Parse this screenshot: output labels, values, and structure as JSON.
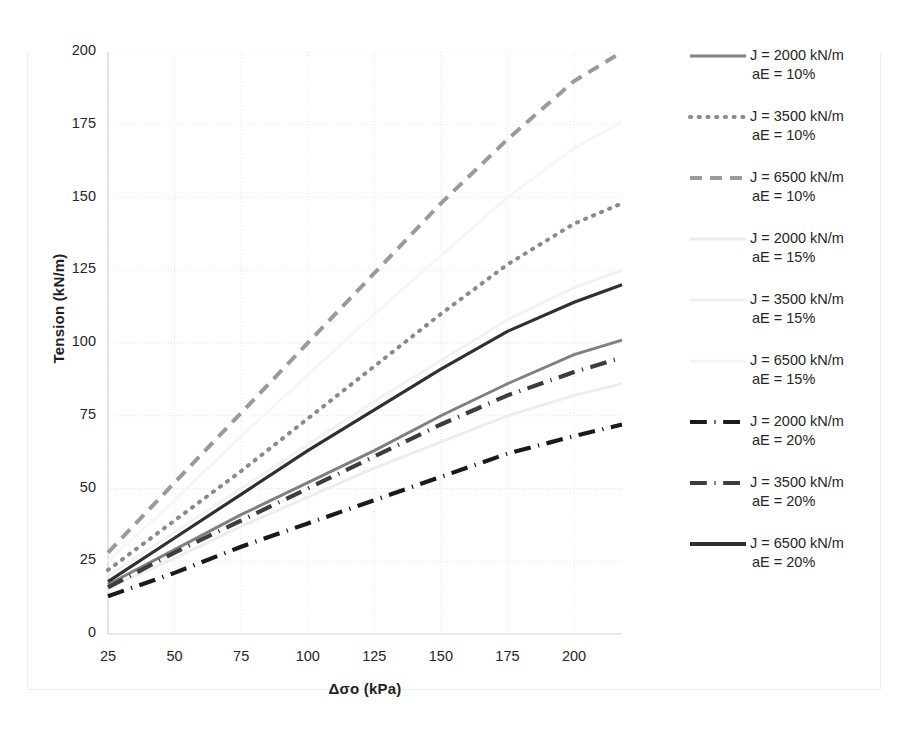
{
  "chart_data": {
    "type": "line",
    "title": "",
    "xlabel": "Δσo (kPa)",
    "ylabel": "Tension (kN/m)",
    "xlim": [
      25,
      218
    ],
    "ylim": [
      0,
      200
    ],
    "xticks": [
      25,
      50,
      75,
      100,
      125,
      150,
      175,
      200
    ],
    "yticks": [
      0,
      25,
      50,
      75,
      100,
      125,
      150,
      175,
      200
    ],
    "grid": "dotted-light",
    "legend_position": "right",
    "x": [
      25,
      50,
      75,
      100,
      125,
      150,
      175,
      200,
      218
    ],
    "series": [
      {
        "name": "J = 2000 kN/m  aE = 10%",
        "J": 2000,
        "aE": "10%",
        "style": "solid",
        "color": "#808080",
        "width": 3.0,
        "values": [
          17,
          29,
          41,
          52,
          63,
          75,
          86,
          96,
          101
        ]
      },
      {
        "name": "J = 3500 kN/m  aE = 10%",
        "J": 3500,
        "aE": "10%",
        "style": "dotted",
        "color": "#8a8a8a",
        "width": 4.0,
        "values": [
          22,
          39,
          56,
          74,
          92,
          110,
          127,
          141,
          148
        ]
      },
      {
        "name": "J = 6500 kN/m  aE = 10%",
        "J": 6500,
        "aE": "10%",
        "style": "dashed",
        "color": "#9a9a9a",
        "width": 4.0,
        "values": [
          28,
          52,
          76,
          100,
          124,
          148,
          170,
          190,
          200
        ]
      },
      {
        "name": "J = 2000 kN/m  aE = 15%",
        "J": 2000,
        "aE": "15%",
        "style": "solid",
        "color": "#ededed",
        "width": 3.0,
        "values": [
          16,
          26,
          37,
          47,
          57,
          66,
          75,
          82,
          86
        ]
      },
      {
        "name": "J = 3500 kN/m  aE = 15%",
        "J": 3500,
        "aE": "15%",
        "style": "solid",
        "color": "#f2f2f2",
        "width": 3.0,
        "values": [
          20,
          35,
          50,
          65,
          80,
          94,
          108,
          119,
          125
        ]
      },
      {
        "name": "J = 6500 kN/m  aE = 15%",
        "J": 6500,
        "aE": "15%",
        "style": "solid",
        "color": "#f6f6f6",
        "width": 3.0,
        "values": [
          25,
          46,
          68,
          89,
          110,
          130,
          150,
          167,
          176
        ]
      },
      {
        "name": "J = 2000 kN/m  aE = 20%",
        "J": 2000,
        "aE": "20%",
        "style": "dashdot",
        "color": "#1a1a1a",
        "width": 4.2,
        "values": [
          13,
          21,
          30,
          38,
          46,
          54,
          62,
          68,
          72
        ]
      },
      {
        "name": "J = 3500 kN/m  aE = 20%",
        "J": 3500,
        "aE": "20%",
        "style": "dashdot",
        "color": "#3d3d3d",
        "width": 4.2,
        "values": [
          16,
          28,
          39,
          50,
          61,
          72,
          82,
          90,
          95
        ]
      },
      {
        "name": "J = 6500 kN/m  aE = 20%",
        "J": 6500,
        "aE": "20%",
        "style": "solid",
        "color": "#303030",
        "width": 3.2,
        "values": [
          18,
          33,
          48,
          63,
          77,
          91,
          104,
          114,
          120
        ]
      }
    ]
  },
  "axes": {
    "y_title": "Tension (kN/m)",
    "x_title": "Δσo (kPa)",
    "y_tick_labels": [
      "200",
      "175",
      "150",
      "125",
      "100",
      "75",
      "50",
      "25",
      "0"
    ],
    "x_tick_labels": [
      "25",
      "50",
      "75",
      "100",
      "125",
      "150",
      "175",
      "200"
    ]
  },
  "legend": {
    "items": [
      {
        "line1": "J = 2000 kN/m",
        "line2": "aE = 10%",
        "style": "solid",
        "color": "#808080",
        "width": 3.0
      },
      {
        "line1": "J = 3500 kN/m",
        "line2": "aE = 10%",
        "style": "dotted",
        "color": "#8a8a8a",
        "width": 4.0
      },
      {
        "line1": "J = 6500 kN/m",
        "line2": "aE = 10%",
        "style": "dashed",
        "color": "#9a9a9a",
        "width": 4.0
      },
      {
        "line1": "J = 2000 kN/m",
        "line2": "aE = 15%",
        "style": "solid",
        "color": "#ebebeb",
        "width": 3.0
      },
      {
        "line1": "J = 3500 kN/m",
        "line2": "aE = 15%",
        "style": "solid",
        "color": "#f0f0f0",
        "width": 3.0
      },
      {
        "line1": "J = 6500 kN/m",
        "line2": "aE = 15%",
        "style": "solid",
        "color": "#f4f4f4",
        "width": 3.0
      },
      {
        "line1": "J = 2000 kN/m",
        "line2": "aE = 20%",
        "style": "dashdot",
        "color": "#1a1a1a",
        "width": 4.2
      },
      {
        "line1": "J = 3500 kN/m",
        "line2": "aE = 20%",
        "style": "dashdot",
        "color": "#3d3d3d",
        "width": 4.2
      },
      {
        "line1": "J = 6500 kN/m",
        "line2": "aE = 20%",
        "style": "solid",
        "color": "#303030",
        "width": 4.2
      }
    ]
  }
}
